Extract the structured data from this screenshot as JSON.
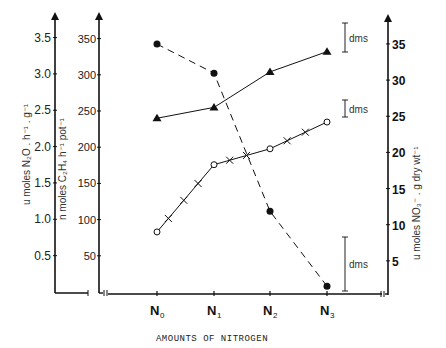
{
  "chart_data": {
    "type": "line",
    "title": "",
    "xlabel": "AMOUNTS OF NITROGEN",
    "categories": [
      "N0",
      "N1",
      "N2",
      "N3"
    ],
    "category_labels": [
      {
        "main": "N",
        "sub": "0"
      },
      {
        "main": "N",
        "sub": "1"
      },
      {
        "main": "N",
        "sub": "2"
      },
      {
        "main": "N",
        "sub": "3"
      }
    ],
    "axes": {
      "left1": {
        "label": "u moles N2O . h-1 . g-1",
        "ticks": [
          "0.5",
          "1.0",
          "1.5",
          "2.0",
          "2.5",
          "3.0",
          "3.5"
        ],
        "ylim": [
          0,
          3.75
        ]
      },
      "left2": {
        "label": "n moles C2H4 . h-1 . pot-1",
        "ticks": [
          "50",
          "100",
          "150",
          "200",
          "250",
          "300",
          "350"
        ],
        "ylim": [
          0,
          375
        ]
      },
      "right": {
        "label": "u moles NO3- . g dry wt-1",
        "ticks": [
          "5",
          "10",
          "15",
          "20",
          "25",
          "30",
          "35"
        ],
        "ylim": [
          0,
          37.5
        ]
      }
    },
    "series": [
      {
        "name": "N2O (filled circles, dashed)",
        "axis": "left1",
        "marker": "filled-circle",
        "line": "dashed",
        "values": [
          3.41,
          3.01,
          1.11,
          0.08
        ]
      },
      {
        "name": "C2H4 (filled triangles, solid)",
        "axis": "left2",
        "marker": "filled-triangle",
        "line": "solid",
        "values": [
          240,
          255,
          304,
          332
        ]
      },
      {
        "name": "NO3- (open circles with crosses, solid)",
        "axis": "right",
        "marker": "open-circle",
        "line": "solid-with-crosses",
        "values": [
          9.0,
          18.3,
          20.5,
          24.2
        ]
      }
    ],
    "annotations": [
      {
        "text": "dms",
        "type": "error-bar"
      },
      {
        "text": "dms",
        "type": "error-bar"
      },
      {
        "text": "dms",
        "type": "error-bar"
      }
    ],
    "grid": false,
    "legend": "none"
  }
}
